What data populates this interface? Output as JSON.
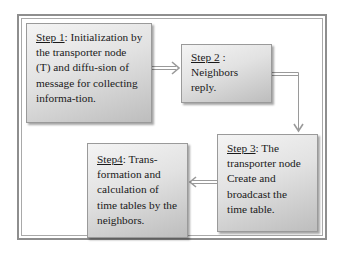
{
  "diagram": {
    "type": "process-flow",
    "steps": [
      {
        "id": 1,
        "label": "Step 1",
        "separator": ": ",
        "text": "Initialization by the transporter node (T) and diffu-sion of message for collecting informa-tion."
      },
      {
        "id": 2,
        "label": "Step 2",
        "separator": " : ",
        "text": "Neighbors reply."
      },
      {
        "id": 3,
        "label": "Step 3",
        "separator": ": ",
        "text": "The transporter node Create and broadcast the time table."
      },
      {
        "id": 4,
        "label": "Step4",
        "separator": ": ",
        "text": "Trans-formation and calculation of time tables by the neighbors."
      }
    ],
    "connections": [
      {
        "from": 1,
        "to": 2,
        "direction": "right"
      },
      {
        "from": 2,
        "to": 3,
        "direction": "down"
      },
      {
        "from": 3,
        "to": 4,
        "direction": "left"
      }
    ],
    "colors": {
      "frame": "#8e8e8e",
      "box_light": "#f4f4f4",
      "box_dark": "#bdbdbd",
      "arrow": "#9a9a9a",
      "text": "#1a1a1a"
    }
  }
}
